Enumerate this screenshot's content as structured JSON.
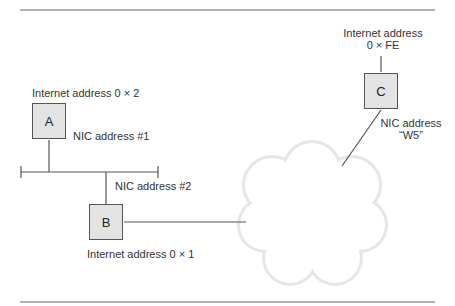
{
  "diagram": {
    "title": "",
    "nodes": [
      {
        "id": "A",
        "label": "A",
        "internet_address": "Internet address 0 × 2",
        "nic_address": "NIC address #1"
      },
      {
        "id": "B",
        "label": "B",
        "internet_address": "Internet address 0 × 1",
        "nic_address": "NIC address #2"
      },
      {
        "id": "C",
        "label": "C",
        "internet_address_line1": "Internet address",
        "internet_address_line2": "0 × FE",
        "nic_address_line1": "NIC address",
        "nic_address_line2": "“W5”"
      }
    ],
    "edges": [
      {
        "from": "A",
        "to": "bus"
      },
      {
        "from": "B",
        "to": "bus"
      },
      {
        "from": "B",
        "to": "cloud"
      },
      {
        "from": "C",
        "to": "cloud"
      }
    ],
    "colors": {
      "line": "#555555",
      "box_fill": "#e3e3e3",
      "cloud_edge": "#d0d0d0"
    }
  }
}
